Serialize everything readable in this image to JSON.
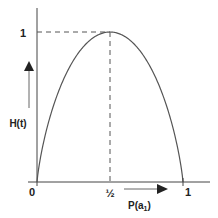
{
  "chart_data": {
    "type": "line",
    "title": "",
    "xlabel": "P(a₁)",
    "ylabel": "H(t)",
    "x_ticks": [
      "0",
      "½",
      "1"
    ],
    "y_ticks": [
      "1"
    ],
    "xlim": [
      0,
      1
    ],
    "ylim": [
      0,
      1
    ],
    "grid": false,
    "legend": null,
    "series": [
      {
        "name": "H(t)",
        "x": [
          0,
          0.1,
          0.2,
          0.3,
          0.4,
          0.5,
          0.6,
          0.7,
          0.8,
          0.9,
          1
        ],
        "values": [
          0,
          0.47,
          0.72,
          0.88,
          0.97,
          1,
          0.97,
          0.88,
          0.72,
          0.47,
          0
        ]
      }
    ],
    "annotations": [
      {
        "type": "dashed-line",
        "from": [
          0,
          1
        ],
        "to": [
          0.5,
          1
        ]
      },
      {
        "type": "dashed-line",
        "from": [
          0.5,
          1
        ],
        "to": [
          0.5,
          0
        ]
      },
      {
        "type": "arrow",
        "direction": "up",
        "near": "y-axis label"
      },
      {
        "type": "arrow",
        "direction": "right",
        "near": "x-axis label"
      }
    ]
  },
  "labels": {
    "origin": "0",
    "x_half": "½",
    "x_one": "1",
    "y_one": "1",
    "x_axis_title": "P(a",
    "x_axis_sub": "1",
    "x_axis_close": ")",
    "y_axis_title": "H(t)"
  }
}
